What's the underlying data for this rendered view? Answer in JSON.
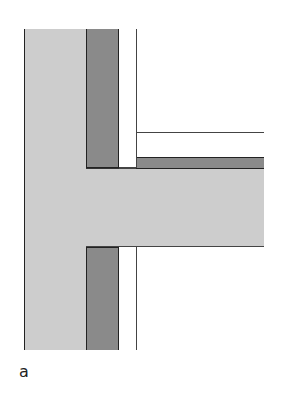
{
  "figure": {
    "label": "a",
    "colors": {
      "structure": "#cdcdcd",
      "insulation": "#8a8a8a",
      "line": "#222222",
      "background": "#ffffff"
    },
    "components": [
      {
        "name": "vertical-wall",
        "material": "structure"
      },
      {
        "name": "horizontal-slab",
        "material": "structure"
      },
      {
        "name": "wall-insulation-upper",
        "material": "insulation"
      },
      {
        "name": "wall-insulation-lower",
        "material": "insulation"
      },
      {
        "name": "slab-insulation",
        "material": "insulation"
      },
      {
        "name": "cavity-line-upper"
      },
      {
        "name": "cavity-line-lower"
      },
      {
        "name": "floor-finish-line"
      }
    ]
  }
}
